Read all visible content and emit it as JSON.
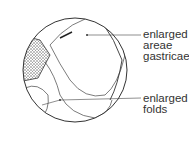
{
  "labels": [
    {
      "id": "areae",
      "lines": [
        "enlarged",
        "areae",
        "gastricae"
      ]
    },
    {
      "id": "folds",
      "lines": [
        "enlarged",
        "folds"
      ]
    }
  ],
  "colors": {
    "ink": "#333333",
    "stipple": "#555555"
  }
}
